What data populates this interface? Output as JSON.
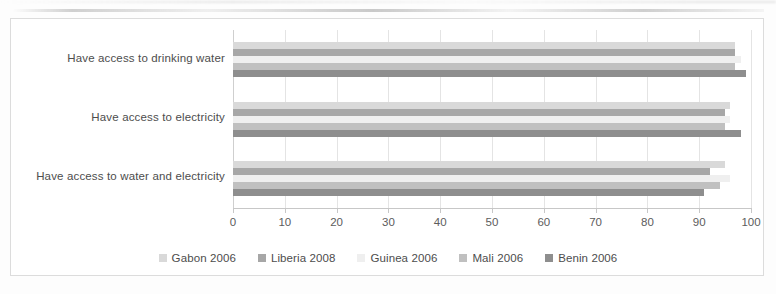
{
  "chart_data": {
    "type": "bar",
    "orientation": "horizontal",
    "title": "",
    "subtitle": "",
    "xlabel": "",
    "ylabel": "",
    "xlim": [
      0,
      100
    ],
    "grid": true,
    "legend_position": "bottom",
    "categories": [
      "Have access to drinking water",
      "Have access to electricity",
      "Have access to water and electricity"
    ],
    "tick_labels": [
      "0",
      "10",
      "20",
      "30",
      "40",
      "50",
      "60",
      "70",
      "80",
      "90",
      "100"
    ],
    "tick_values": [
      0,
      10,
      20,
      30,
      40,
      50,
      60,
      70,
      80,
      90,
      100
    ],
    "series": [
      {
        "name": "Gabon 2006",
        "color": "#d9d9d9",
        "values": [
          97,
          96,
          95
        ]
      },
      {
        "name": "Liberia 2008",
        "color": "#a6a6a6",
        "values": [
          97,
          95,
          92
        ]
      },
      {
        "name": "Guinea 2006",
        "color": "#efefef",
        "values": [
          98,
          96,
          96
        ]
      },
      {
        "name": "Mali 2006",
        "color": "#bfbfbf",
        "values": [
          97,
          95,
          94
        ]
      },
      {
        "name": "Benin 2006",
        "color": "#8c8c8c",
        "values": [
          99,
          98,
          91
        ]
      }
    ]
  },
  "legend": {
    "items": [
      {
        "label": "Gabon 2006",
        "color": "#d9d9d9"
      },
      {
        "label": "Liberia 2008",
        "color": "#a6a6a6"
      },
      {
        "label": "Guinea 2006",
        "color": "#efefef"
      },
      {
        "label": "Mali 2006",
        "color": "#bfbfbf"
      },
      {
        "label": "Benin 2006",
        "color": "#8c8c8c"
      }
    ]
  }
}
